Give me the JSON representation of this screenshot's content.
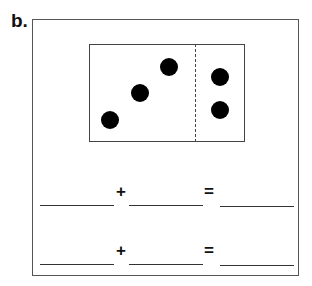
{
  "problem_label": "b.",
  "dot_frame": {
    "left_dots": 3,
    "right_dots": 2,
    "dots": [
      {
        "x": 110,
        "y": 120
      },
      {
        "x": 140,
        "y": 93
      },
      {
        "x": 169,
        "y": 67
      },
      {
        "x": 220,
        "y": 77
      },
      {
        "x": 220,
        "y": 110
      }
    ]
  },
  "equations": [
    {
      "plus": "+",
      "equals": "=",
      "addend1": "",
      "addend2": "",
      "sum": ""
    },
    {
      "plus": "+",
      "equals": "=",
      "addend1": "",
      "addend2": "",
      "sum": ""
    }
  ]
}
